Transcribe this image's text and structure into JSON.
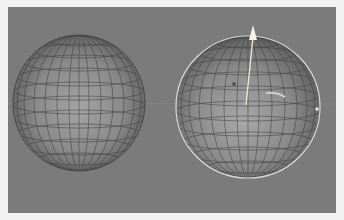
{
  "viewport": {
    "label": "3D viewport",
    "background": "#7b7b7b"
  },
  "objects": [
    {
      "name": "sphere-left",
      "selected": false,
      "center": [
        71,
        96
      ],
      "radius": [
        66,
        68
      ]
    },
    {
      "name": "sphere-right",
      "selected": true,
      "center": [
        240,
        100
      ],
      "radius": [
        72,
        71
      ]
    }
  ],
  "gizmo": {
    "axis": "Y",
    "color": "#f4f1e6"
  },
  "colors": {
    "frame": "#f2f2f2",
    "sphere_light": "#a3a3a3",
    "sphere_dark": "#505050",
    "wire": "#3e3e3e",
    "selection": "#d8d8d8"
  }
}
